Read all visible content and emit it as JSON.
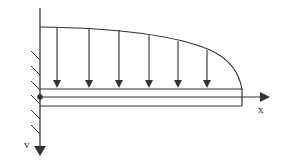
{
  "diagram": {
    "title": "",
    "type": "cantilever beam with distributed load",
    "axis_labels": {
      "x": "x",
      "v": "v"
    },
    "colors": {
      "stroke": "#333333",
      "background": "#ffffff"
    },
    "load_arrows_count": 6,
    "support": "fixed wall (left)",
    "origin_marker": "filled dot at wall on beam axis"
  }
}
